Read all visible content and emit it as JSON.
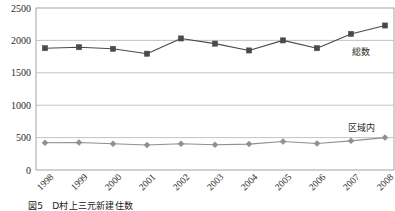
{
  "figure": {
    "caption": "図5　D村上三元新建住数"
  },
  "chart_data": {
    "type": "line",
    "title": "",
    "xlabel": "",
    "ylabel": "",
    "categories": [
      "1998",
      "1999",
      "2000",
      "2001",
      "2002",
      "2003",
      "2004",
      "2005",
      "2006",
      "2007",
      "2008"
    ],
    "yticks": [
      "0",
      "500",
      "1000",
      "1500",
      "2000",
      "2500"
    ],
    "ylim": [
      0,
      2500
    ],
    "grid": true,
    "legend_position": "inline-right",
    "series": [
      {
        "name": "総数",
        "label": "総数",
        "color": "#4a4a4a",
        "marker": "square",
        "values": [
          1880,
          1895,
          1870,
          1795,
          2030,
          1950,
          1845,
          2000,
          1880,
          2100,
          2230
        ]
      },
      {
        "name": "区域内",
        "label": "区域内",
        "color": "#8f8f8f",
        "marker": "diamond",
        "values": [
          420,
          425,
          405,
          385,
          405,
          390,
          400,
          440,
          410,
          450,
          500
        ]
      }
    ]
  }
}
